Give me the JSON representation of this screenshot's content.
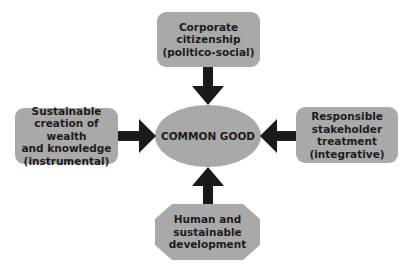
{
  "diagram": {
    "center": {
      "label": "COMMON GOOD"
    },
    "nodes": [
      {
        "id": "top",
        "label": "Corporate citizenship (politico-social)",
        "lines": [
          "Corporate",
          "citizenship",
          "(politico-social)"
        ],
        "shape": "rounded-rect"
      },
      {
        "id": "left",
        "label": "Sustainable creation of wealth and knowledge (instrumental)",
        "lines": [
          "Sustainable",
          "creation of wealth",
          "and knowledge",
          "(instrumental)"
        ],
        "shape": "rounded-rect"
      },
      {
        "id": "right",
        "label": "Responsible stakeholder treatment (integrative)",
        "lines": [
          "Responsible",
          "stakeholder",
          "treatment",
          "(integrative)"
        ],
        "shape": "rounded-rect"
      },
      {
        "id": "bottom",
        "label": "Human and sustainable development",
        "lines": [
          "Human and",
          "sustainable",
          "development"
        ],
        "shape": "octagon"
      }
    ],
    "edges": [
      {
        "from": "top",
        "to": "center"
      },
      {
        "from": "left",
        "to": "center"
      },
      {
        "from": "right",
        "to": "center"
      },
      {
        "from": "bottom",
        "to": "center"
      }
    ],
    "colors": {
      "fill": "#a9a9a9",
      "arrow": "#1a1a1a",
      "text": "#1c1c1c"
    }
  }
}
